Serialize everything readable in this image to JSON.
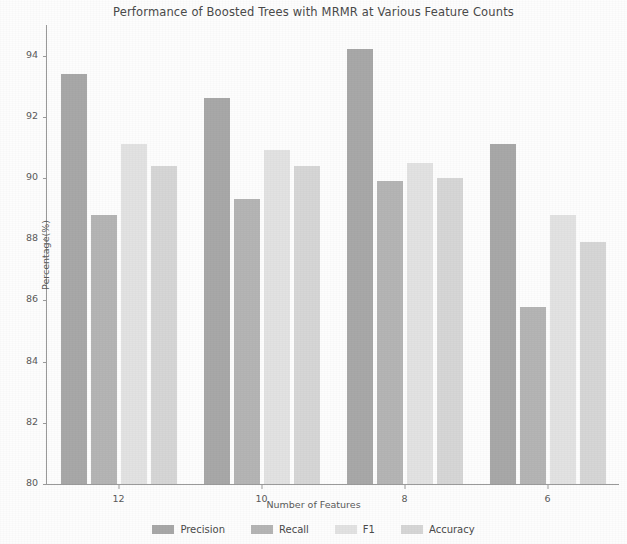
{
  "chart_data": {
    "type": "bar",
    "title": "Performance of Boosted Trees with MRMR at Various Feature Counts",
    "xlabel": "Number of Features",
    "ylabel": "Percentage(%)",
    "categories": [
      "12",
      "10",
      "8",
      "6"
    ],
    "series": [
      {
        "name": "Precision",
        "color": "#a8a8a8",
        "values": [
          93.4,
          92.6,
          94.2,
          91.1
        ]
      },
      {
        "name": "Recall",
        "color": "#b5b5b5",
        "values": [
          88.8,
          89.3,
          89.9,
          85.8
        ]
      },
      {
        "name": "F1",
        "color": "#e2e2e2",
        "values": [
          91.1,
          90.9,
          90.5,
          88.8
        ]
      },
      {
        "name": "Accuracy",
        "color": "#d6d6d6",
        "values": [
          90.4,
          90.4,
          90.0,
          87.9
        ]
      }
    ],
    "ylim": [
      80,
      95
    ],
    "yticks": [
      "80",
      "82",
      "84",
      "86",
      "88",
      "90",
      "92",
      "94"
    ],
    "ytick_values": [
      80,
      82,
      84,
      86,
      88,
      90,
      92,
      94
    ],
    "grid": false,
    "legend_position": "bottom"
  }
}
